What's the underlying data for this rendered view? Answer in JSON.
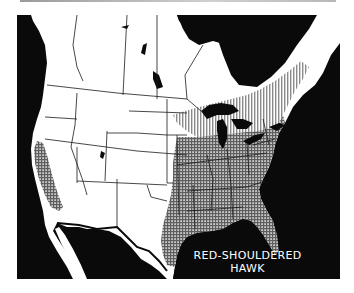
{
  "map": {
    "title_lines": [
      "RED-SHOULDERED",
      "HAWK"
    ],
    "region": "North America (United States, southern Canada, northern Mexico)",
    "style": "black-and-white range map",
    "colors": {
      "water": "#0a0a0a",
      "land": "#ffffff",
      "borders": "#1a1a1a",
      "vertical_hatch_shading": "#bdbdbd",
      "cross_hatch_shading": "#8e8e8e",
      "label_text": "#ffffff"
    },
    "shaded_areas": [
      {
        "pattern": "vertical hatch (lighter)",
        "location": "northern band across Great Lakes region, southern Ontario/Quebec, northern New England"
      },
      {
        "pattern": "cross hatch (darker)",
        "location": "eastern United States from the Great Lakes south to Florida and the Gulf Coast, west into Texas and northeastern Mexico"
      },
      {
        "pattern": "cross hatch (darker)",
        "location": "coastal and central California strip"
      }
    ]
  }
}
